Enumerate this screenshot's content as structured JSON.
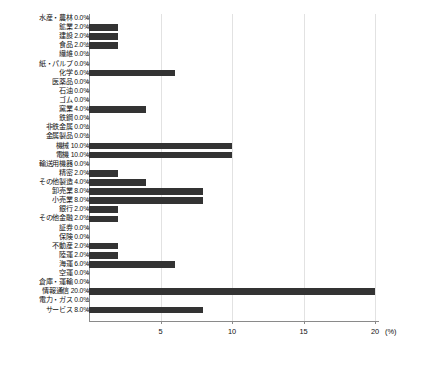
{
  "chart_data": {
    "type": "bar",
    "orientation": "horizontal",
    "title": "",
    "xlabel": "(%)",
    "ylabel": "",
    "xlim": [
      0,
      20
    ],
    "xticks": [
      5,
      10,
      15,
      20
    ],
    "xtick_labels": [
      "5",
      "10",
      "15",
      "20"
    ],
    "x_unit_label": "(%)",
    "grid": true,
    "legend": "none",
    "bar_color": "#333333",
    "axis_color": "#8a8a8a",
    "gridline_color": "#e2e2e2",
    "value_label_suffix": "%",
    "categories": [
      "水産・農林",
      "鉱業",
      "建設",
      "食品",
      "繊維",
      "紙・パルプ",
      "化学",
      "医薬品",
      "石油",
      "ゴム",
      "窯業",
      "鉄鋼",
      "非鉄金属",
      "金属製品",
      "機械",
      "電機",
      "輸送用機器",
      "精密",
      "その他製造",
      "卸売業",
      "小売業",
      "銀行",
      "その他金融",
      "証券",
      "保険",
      "不動産",
      "陸運",
      "海運",
      "空運",
      "倉庫・運輸",
      "情報通信",
      "電力・ガス",
      "サービス"
    ],
    "values": [
      0.0,
      2.0,
      2.0,
      2.0,
      0.0,
      0.0,
      6.0,
      0.0,
      0.0,
      0.0,
      4.0,
      0.0,
      0.0,
      0.0,
      10.0,
      10.0,
      0.0,
      2.0,
      4.0,
      8.0,
      8.0,
      2.0,
      2.0,
      0.0,
      0.0,
      2.0,
      2.0,
      6.0,
      0.0,
      0.0,
      20.0,
      0.0,
      8.0
    ],
    "value_labels": [
      "0.0%",
      "2.0%",
      "2.0%",
      "2.0%",
      "0.0%",
      "0.0%",
      "6.0%",
      "0.0%",
      "0.0%",
      "0.0%",
      "4.0%",
      "0.0%",
      "0.0%",
      "0.0%",
      "10.0%",
      "10.0%",
      "0.0%",
      "2.0%",
      "4.0%",
      "8.0%",
      "8.0%",
      "2.0%",
      "2.0%",
      "0.0%",
      "0.0%",
      "2.0%",
      "2.0%",
      "6.0%",
      "0.0%",
      "0.0%",
      "20.0%",
      "0.0%",
      "8.0%"
    ]
  }
}
